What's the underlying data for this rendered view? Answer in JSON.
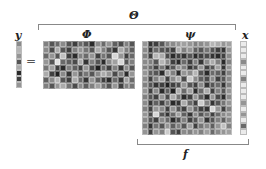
{
  "labels": {
    "theta": "Θ",
    "phi": "Φ",
    "psi": "ψ",
    "x": "x",
    "y": "y",
    "f": "f",
    "equals": "="
  },
  "matrices": {
    "y": {
      "rows": 8,
      "cols": 1,
      "values": [
        0.55,
        0.75,
        0.6,
        0.3,
        0.7,
        0.1,
        0.2,
        0.6
      ]
    },
    "phi": {
      "rows": 8,
      "cols": 16,
      "values": [
        0.5,
        0.3,
        0.4,
        0.55,
        0.3,
        0.2,
        0.4,
        0.3,
        0.1,
        0.55,
        0.4,
        0.6,
        0.35,
        0.25,
        0.5,
        0.3,
        0.55,
        0.25,
        0.7,
        0.3,
        0.2,
        0.5,
        0.6,
        0.45,
        0.3,
        0.7,
        0.5,
        0.3,
        0.15,
        0.7,
        0.5,
        0.35,
        0.4,
        0.6,
        0.3,
        0.8,
        0.2,
        0.1,
        0.5,
        0.4,
        0.6,
        0.2,
        0.45,
        0.3,
        0.9,
        0.6,
        0.2,
        0.4,
        0.6,
        0.3,
        0.95,
        0.4,
        0.35,
        0.25,
        0.7,
        0.15,
        0.5,
        0.3,
        0.1,
        0.55,
        0.65,
        0.9,
        0.3,
        0.5,
        0.45,
        0.65,
        0.2,
        0.1,
        0.5,
        0.35,
        0.2,
        0.6,
        0.25,
        0.05,
        0.4,
        0.2,
        0.5,
        0.15,
        0.55,
        0.3,
        0.7,
        0.2,
        0.05,
        0.55,
        0.15,
        0.6,
        0.3,
        0.45,
        0.3,
        0.55,
        0.7,
        0.6,
        0.25,
        0.5,
        0.1,
        0.6,
        0.35,
        0.55,
        0.75,
        0.3,
        0.2,
        0.7,
        0.4,
        0.15,
        0.6,
        0.35,
        0.2,
        0.1,
        0.4,
        0.15,
        0.65,
        0.4,
        0.5,
        0.3,
        0.6,
        0.7,
        0.45,
        0.25,
        0.55,
        0.35,
        0.5,
        0.65,
        0.45,
        0.3,
        0.6,
        0.2,
        0.5,
        0.45
      ]
    },
    "psi": {
      "rows": 16,
      "cols": 16,
      "values": [
        0.6,
        0.15,
        0.2,
        0.3,
        0.5,
        0.55,
        0.6,
        0.65,
        0.6,
        0.5,
        0.55,
        0.6,
        0.75,
        0.7,
        0.6,
        0.65,
        0.55,
        0.15,
        0.4,
        0.3,
        0.25,
        0.2,
        0.7,
        0.5,
        0.6,
        0.35,
        0.3,
        0.45,
        0.3,
        0.2,
        0.15,
        0.6,
        0.5,
        0.2,
        0.75,
        0.7,
        0.25,
        0.1,
        0.2,
        0.15,
        0.3,
        0.1,
        0.2,
        0.25,
        0.15,
        0.1,
        0.2,
        0.55,
        0.55,
        0.5,
        0.3,
        0.75,
        0.55,
        0.2,
        0.1,
        0.4,
        0.2,
        0.5,
        0.15,
        0.55,
        0.7,
        0.5,
        0.1,
        0.5,
        0.5,
        0.4,
        0.2,
        0.45,
        0.15,
        0.3,
        0.6,
        0.5,
        0.15,
        0.25,
        0.6,
        0.2,
        0.3,
        0.65,
        0.15,
        0.6,
        0.6,
        0.35,
        0.3,
        0.1,
        0.65,
        0.5,
        0.1,
        0.6,
        0.55,
        0.75,
        0.3,
        0.1,
        0.4,
        0.35,
        0.2,
        0.5,
        0.55,
        0.2,
        0.5,
        0.65,
        0.2,
        0.55,
        0.7,
        0.25,
        0.85,
        0.55,
        0.35,
        0.25,
        0.55,
        0.2,
        0.3,
        0.55,
        0.5,
        0.3,
        0.15,
        0.2,
        0.05,
        0.2,
        0.25,
        0.6,
        0.3,
        0.2,
        0.55,
        0.15,
        0.3,
        0.4,
        0.15,
        0.5,
        0.6,
        0.2,
        0.55,
        0.1,
        0.35,
        0.05,
        0.7,
        0.4,
        0.65,
        0.1,
        0.4,
        0.7,
        0.2,
        0.5,
        0.3,
        0.6,
        0.5,
        0.3,
        0.2,
        0.6,
        0.25,
        0.7,
        0.45,
        0.1,
        0.2,
        0.6,
        0.35,
        0.1,
        0.6,
        0.25,
        0.1,
        0.55,
        0.55,
        0.15,
        0.35,
        0.2,
        0.45,
        0.1,
        0.15,
        0.7,
        0.4,
        0.2,
        0.85,
        0.5,
        0.15,
        0.3,
        0.45,
        0.6,
        0.5,
        0.2,
        0.6,
        0.55,
        0.2,
        0.6,
        0.3,
        0.2,
        0.6,
        0.35,
        0.2,
        0.15,
        0.9,
        0.6,
        0.2,
        0.5,
        0.6,
        0.25,
        0.9,
        0.3,
        0.15,
        0.4,
        0.65,
        0.35,
        0.15,
        0.55,
        0.3,
        0.45,
        0.2,
        0.4,
        0.55,
        0.6,
        0.55,
        0.3,
        0.2,
        0.55,
        0.4,
        0.1,
        0.25,
        0.5,
        0.2,
        0.3,
        0.6,
        0.15,
        0.3,
        0.5,
        0.35,
        0.55,
        0.5,
        0.15,
        0.45,
        0.3,
        0.6,
        0.35,
        0.5,
        0.3,
        0.65,
        0.2,
        0.45,
        0.55,
        0.35,
        0.6,
        0.8,
        0.5,
        0.6,
        0.2,
        0.6,
        0.5,
        0.85,
        0.3,
        0.2,
        0.55,
        0.5,
        0.6,
        0.5,
        0.65,
        0.4,
        0.55,
        0.6,
        0.65
      ]
    },
    "x": {
      "rows": 16,
      "cols": 1,
      "values": [
        1,
        1,
        1,
        0.55,
        1,
        1,
        0.5,
        1,
        1,
        1,
        0.6,
        1,
        0.6,
        1,
        0.4,
        1
      ]
    }
  }
}
